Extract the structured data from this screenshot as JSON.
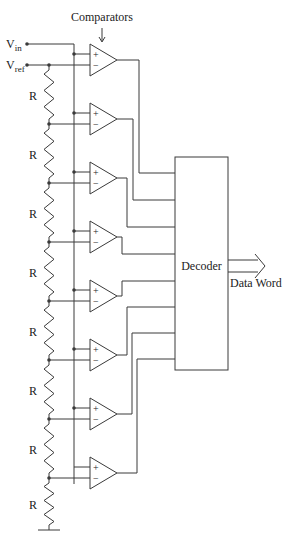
{
  "labels": {
    "comparators": "Comparators",
    "vin": "V",
    "vin_sub": "in",
    "vref": "V",
    "vref_sub": "ref",
    "decoder": "Decoder",
    "output": "Data Word",
    "resistor": "R"
  },
  "colors": {
    "line": "#3a3a3a",
    "text": "#222222",
    "background": "#ffffff"
  },
  "layout": {
    "comparator_count": 8,
    "resistor_count": 8,
    "first_comparator_top": 44,
    "comparator_pitch": 59,
    "ladder_x": 49,
    "vin_bus_x": 74,
    "decoder": {
      "x": 175,
      "y": 157,
      "w": 53,
      "h": 213
    },
    "decoder_inputs_y": [
      173,
      200,
      227,
      254,
      281,
      307,
      333,
      359
    ],
    "output_columns_x": [
      139,
      133,
      127,
      122,
      122,
      127,
      132,
      137
    ]
  }
}
